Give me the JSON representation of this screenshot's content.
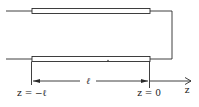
{
  "diagram": {
    "type": "shorted transmission line",
    "colors": {
      "stroke": "#2a2a2a",
      "fill": "#ffffff",
      "background": "#ffffff"
    },
    "labels": {
      "length": "ℓ",
      "left_position": "z = −ℓ",
      "right_position": "z = 0",
      "axis": "z"
    }
  }
}
